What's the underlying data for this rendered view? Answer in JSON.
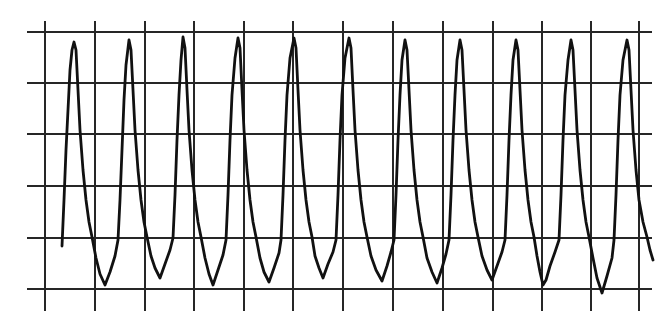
{
  "chart_data": {
    "type": "line",
    "title": "",
    "xlabel": "",
    "ylabel": "",
    "grid": true,
    "legend": null,
    "grid_spec": {
      "vertical_lines_x": [
        45,
        95,
        145,
        194,
        244,
        293,
        343,
        393,
        443,
        493,
        542,
        591,
        639
      ],
      "vertical_line_y_range": [
        21,
        311
      ],
      "horizontal_lines_y": [
        32,
        83,
        134,
        186,
        238,
        289
      ],
      "horizontal_line_x_range": [
        27,
        652
      ]
    },
    "colors": {
      "background": "#ffffff",
      "grid": "#262626",
      "wave": "#111111"
    },
    "series": [
      {
        "name": "waveform",
        "peaks_x": [
          74,
          129,
          183,
          238,
          294,
          349,
          405,
          460,
          516,
          571,
          627
        ],
        "peak_y": [
          42,
          40,
          37,
          38,
          38,
          38,
          40,
          40,
          40,
          40,
          40
        ],
        "troughs_x": [
          105,
          160,
          213,
          269,
          323,
          382,
          437,
          492,
          543,
          602
        ],
        "trough_y": [
          285,
          278,
          285,
          282,
          278,
          281,
          283,
          280,
          285,
          293
        ],
        "start": [
          62,
          246
        ],
        "end": [
          653,
          260
        ],
        "points": [
          [
            62,
            246
          ],
          [
            64,
            200
          ],
          [
            66,
            150
          ],
          [
            68,
            110
          ],
          [
            70,
            70
          ],
          [
            72,
            50
          ],
          [
            74,
            42
          ],
          [
            76,
            50
          ],
          [
            78,
            90
          ],
          [
            80,
            130
          ],
          [
            83,
            170
          ],
          [
            86,
            200
          ],
          [
            89,
            222
          ],
          [
            92,
            237
          ],
          [
            96,
            258
          ],
          [
            100,
            274
          ],
          [
            105,
            285
          ],
          [
            110,
            272
          ],
          [
            115,
            256
          ],
          [
            118,
            240
          ],
          [
            120,
            200
          ],
          [
            122,
            150
          ],
          [
            124,
            100
          ],
          [
            126,
            65
          ],
          [
            129,
            40
          ],
          [
            131,
            50
          ],
          [
            133,
            90
          ],
          [
            135,
            130
          ],
          [
            138,
            170
          ],
          [
            141,
            200
          ],
          [
            144,
            222
          ],
          [
            147,
            237
          ],
          [
            151,
            256
          ],
          [
            155,
            268
          ],
          [
            160,
            278
          ],
          [
            165,
            264
          ],
          [
            170,
            250
          ],
          [
            173,
            238
          ],
          [
            175,
            195
          ],
          [
            177,
            140
          ],
          [
            179,
            95
          ],
          [
            181,
            60
          ],
          [
            183,
            37
          ],
          [
            185,
            48
          ],
          [
            187,
            90
          ],
          [
            189,
            130
          ],
          [
            192,
            170
          ],
          [
            195,
            200
          ],
          [
            198,
            222
          ],
          [
            201,
            237
          ],
          [
            205,
            258
          ],
          [
            209,
            274
          ],
          [
            213,
            285
          ],
          [
            218,
            270
          ],
          [
            223,
            255
          ],
          [
            226,
            240
          ],
          [
            228,
            195
          ],
          [
            230,
            140
          ],
          [
            232,
            95
          ],
          [
            235,
            58
          ],
          [
            238,
            38
          ],
          [
            240,
            48
          ],
          [
            242,
            90
          ],
          [
            244,
            130
          ],
          [
            247,
            170
          ],
          [
            250,
            200
          ],
          [
            253,
            222
          ],
          [
            256,
            237
          ],
          [
            260,
            258
          ],
          [
            264,
            272
          ],
          [
            269,
            282
          ],
          [
            274,
            268
          ],
          [
            279,
            253
          ],
          [
            281,
            240
          ],
          [
            283,
            195
          ],
          [
            285,
            140
          ],
          [
            287,
            95
          ],
          [
            290,
            58
          ],
          [
            294,
            38
          ],
          [
            296,
            48
          ],
          [
            298,
            90
          ],
          [
            300,
            130
          ],
          [
            303,
            170
          ],
          [
            306,
            200
          ],
          [
            309,
            222
          ],
          [
            312,
            237
          ],
          [
            315,
            256
          ],
          [
            319,
            268
          ],
          [
            323,
            278
          ],
          [
            328,
            264
          ],
          [
            333,
            252
          ],
          [
            336,
            240
          ],
          [
            338,
            195
          ],
          [
            340,
            140
          ],
          [
            342,
            95
          ],
          [
            345,
            58
          ],
          [
            349,
            38
          ],
          [
            351,
            48
          ],
          [
            353,
            90
          ],
          [
            355,
            130
          ],
          [
            358,
            170
          ],
          [
            361,
            200
          ],
          [
            364,
            222
          ],
          [
            367,
            237
          ],
          [
            371,
            256
          ],
          [
            376,
            270
          ],
          [
            382,
            281
          ],
          [
            387,
            266
          ],
          [
            391,
            252
          ],
          [
            394,
            240
          ],
          [
            396,
            195
          ],
          [
            398,
            140
          ],
          [
            400,
            95
          ],
          [
            402,
            60
          ],
          [
            405,
            40
          ],
          [
            407,
            50
          ],
          [
            409,
            90
          ],
          [
            411,
            130
          ],
          [
            414,
            170
          ],
          [
            417,
            200
          ],
          [
            420,
            222
          ],
          [
            423,
            237
          ],
          [
            427,
            258
          ],
          [
            432,
            272
          ],
          [
            437,
            283
          ],
          [
            442,
            268
          ],
          [
            446,
            254
          ],
          [
            449,
            240
          ],
          [
            451,
            195
          ],
          [
            453,
            140
          ],
          [
            455,
            95
          ],
          [
            457,
            60
          ],
          [
            460,
            40
          ],
          [
            462,
            50
          ],
          [
            464,
            90
          ],
          [
            466,
            130
          ],
          [
            469,
            170
          ],
          [
            472,
            200
          ],
          [
            475,
            222
          ],
          [
            478,
            237
          ],
          [
            482,
            256
          ],
          [
            487,
            270
          ],
          [
            492,
            280
          ],
          [
            497,
            266
          ],
          [
            502,
            252
          ],
          [
            505,
            240
          ],
          [
            507,
            195
          ],
          [
            509,
            140
          ],
          [
            511,
            95
          ],
          [
            513,
            60
          ],
          [
            516,
            40
          ],
          [
            518,
            50
          ],
          [
            520,
            90
          ],
          [
            522,
            130
          ],
          [
            525,
            170
          ],
          [
            528,
            200
          ],
          [
            531,
            222
          ],
          [
            534,
            237
          ],
          [
            537,
            256
          ],
          [
            540,
            272
          ],
          [
            543,
            285
          ],
          [
            546,
            280
          ],
          [
            550,
            266
          ],
          [
            555,
            252
          ],
          [
            559,
            240
          ],
          [
            561,
            195
          ],
          [
            563,
            140
          ],
          [
            565,
            95
          ],
          [
            568,
            60
          ],
          [
            571,
            40
          ],
          [
            573,
            50
          ],
          [
            575,
            90
          ],
          [
            577,
            130
          ],
          [
            580,
            170
          ],
          [
            583,
            200
          ],
          [
            586,
            222
          ],
          [
            589,
            237
          ],
          [
            593,
            258
          ],
          [
            597,
            278
          ],
          [
            602,
            293
          ],
          [
            607,
            276
          ],
          [
            612,
            258
          ],
          [
            614,
            240
          ],
          [
            616,
            195
          ],
          [
            618,
            140
          ],
          [
            620,
            95
          ],
          [
            623,
            60
          ],
          [
            627,
            40
          ],
          [
            629,
            50
          ],
          [
            631,
            90
          ],
          [
            633,
            130
          ],
          [
            636,
            170
          ],
          [
            639,
            200
          ],
          [
            643,
            222
          ],
          [
            647,
            237
          ],
          [
            650,
            250
          ],
          [
            653,
            260
          ]
        ]
      }
    ]
  }
}
